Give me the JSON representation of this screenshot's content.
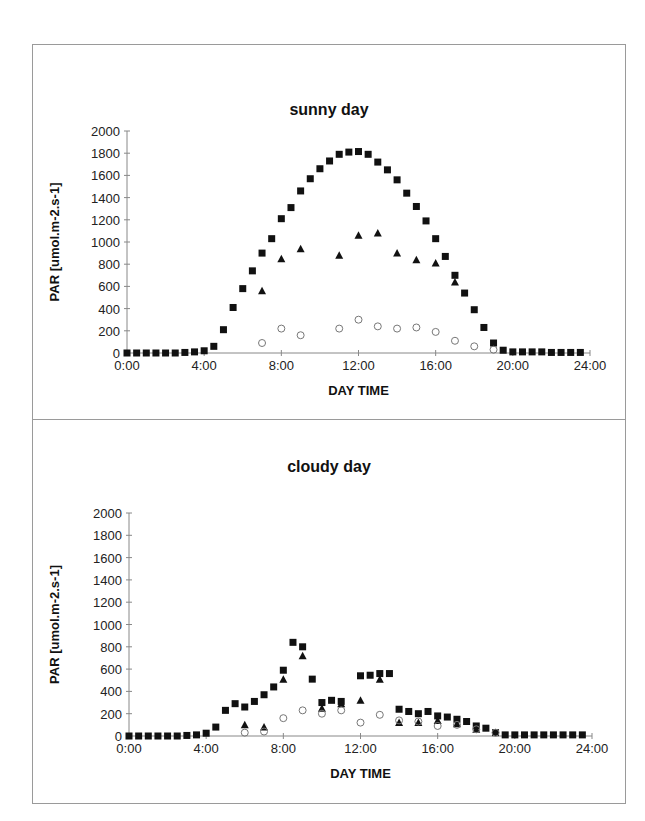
{
  "chart_data": [
    {
      "type": "scatter",
      "title": "sunny day",
      "xlabel": "DAY TIME",
      "ylabel": "PAR [umol.m-2.s-1]",
      "ylim": [
        0,
        2000
      ],
      "xlim": [
        0,
        24
      ],
      "yticks": [
        0,
        200,
        400,
        600,
        800,
        1000,
        1200,
        1400,
        1600,
        1800,
        2000
      ],
      "xticks": [
        "0:00",
        "4:00",
        "8:00",
        "12:00",
        "16:00",
        "20:00",
        "24:00"
      ],
      "grid": false,
      "legend": null,
      "series": [
        {
          "name": "squares",
          "marker": "filled-square",
          "x": [
            0,
            0.5,
            1,
            1.5,
            2,
            2.5,
            3,
            3.5,
            4,
            4.5,
            5,
            5.5,
            6,
            6.5,
            7,
            7.5,
            8,
            8.5,
            9,
            9.5,
            10,
            10.5,
            11,
            11.5,
            12,
            12.5,
            13,
            13.5,
            14,
            14.5,
            15,
            15.5,
            16,
            16.5,
            17,
            17.5,
            18,
            18.5,
            19,
            19.5,
            20,
            20.5,
            21,
            21.5,
            22,
            22.5,
            23,
            23.5
          ],
          "values": [
            0,
            0,
            0,
            0,
            0,
            0,
            5,
            10,
            20,
            60,
            210,
            410,
            580,
            740,
            900,
            1030,
            1210,
            1310,
            1460,
            1570,
            1660,
            1730,
            1790,
            1810,
            1815,
            1790,
            1720,
            1650,
            1560,
            1440,
            1320,
            1190,
            1030,
            870,
            700,
            540,
            390,
            230,
            90,
            25,
            10,
            10,
            10,
            10,
            5,
            5,
            5,
            5
          ]
        },
        {
          "name": "triangles",
          "marker": "filled-triangle",
          "x": [
            7,
            8,
            9,
            11,
            12,
            13,
            14,
            15,
            16,
            17
          ],
          "values": [
            560,
            850,
            940,
            880,
            1060,
            1080,
            900,
            840,
            810,
            640
          ]
        },
        {
          "name": "circles",
          "marker": "open-circle",
          "x": [
            7,
            8,
            9,
            11,
            12,
            13,
            14,
            15,
            16,
            17,
            18,
            19
          ],
          "values": [
            90,
            220,
            160,
            220,
            300,
            240,
            220,
            230,
            190,
            110,
            60,
            30
          ]
        }
      ]
    },
    {
      "type": "scatter",
      "title": "cloudy day",
      "xlabel": "DAY TIME",
      "ylabel": "PAR [umol.m-2.s-1]",
      "ylim": [
        0,
        2000
      ],
      "xlim": [
        0,
        24
      ],
      "yticks": [
        0,
        200,
        400,
        600,
        800,
        1000,
        1200,
        1400,
        1600,
        1800,
        2000
      ],
      "xticks": [
        "0:00",
        "4:00",
        "8:00",
        "12:00",
        "16:00",
        "20:00",
        "24:00"
      ],
      "grid": false,
      "legend": null,
      "series": [
        {
          "name": "squares",
          "marker": "filled-square",
          "x": [
            0,
            0.5,
            1,
            1.5,
            2,
            2.5,
            3,
            3.5,
            4,
            4.5,
            5,
            5.5,
            6,
            6.5,
            7,
            7.5,
            8,
            8.5,
            9,
            9.5,
            10,
            10.5,
            11,
            12,
            12.5,
            13,
            13.5,
            14,
            14.5,
            15,
            15.5,
            16,
            16.5,
            17,
            17.5,
            18,
            18.5,
            19,
            19.5,
            20,
            20.5,
            21,
            21.5,
            22,
            22.5,
            23,
            23.5
          ],
          "values": [
            0,
            0,
            0,
            0,
            0,
            0,
            5,
            10,
            25,
            80,
            230,
            290,
            260,
            310,
            370,
            440,
            590,
            840,
            800,
            510,
            300,
            320,
            310,
            540,
            545,
            560,
            560,
            240,
            220,
            200,
            220,
            180,
            170,
            150,
            130,
            90,
            70,
            30,
            10,
            10,
            10,
            10,
            10,
            10,
            10,
            10,
            10
          ]
        },
        {
          "name": "triangles",
          "marker": "filled-triangle",
          "x": [
            6,
            7,
            8,
            9,
            10,
            11,
            12,
            13,
            14,
            15,
            16,
            17,
            18
          ],
          "values": [
            100,
            80,
            510,
            720,
            250,
            290,
            320,
            510,
            120,
            120,
            140,
            110,
            60
          ]
        },
        {
          "name": "circles",
          "marker": "open-circle",
          "x": [
            6,
            7,
            8,
            9,
            10,
            11,
            12,
            13,
            14,
            15,
            16,
            17,
            18,
            19
          ],
          "values": [
            30,
            40,
            160,
            230,
            200,
            230,
            120,
            190,
            140,
            130,
            90,
            100,
            60,
            30
          ]
        }
      ]
    }
  ],
  "panels": {
    "sunny": {
      "title": "sunny day",
      "xlabel": "DAY TIME",
      "ylabel": "PAR [umol.m-2.s-1]"
    },
    "cloudy": {
      "title": "cloudy day",
      "xlabel": "DAY TIME",
      "ylabel": "PAR [umol.m-2.s-1]"
    }
  }
}
